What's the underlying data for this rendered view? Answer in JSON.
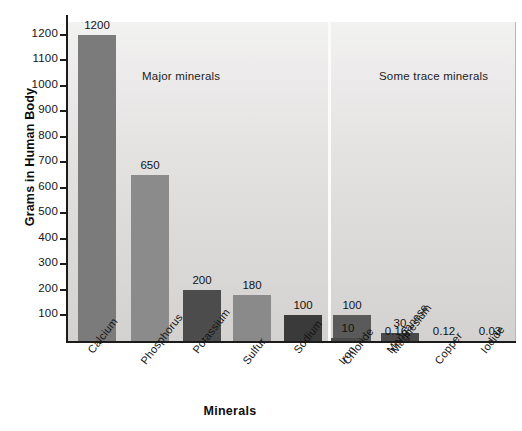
{
  "chart_data": {
    "type": "bar",
    "title": "",
    "xlabel": "Minerals",
    "ylabel": "Grams in Human Body",
    "ylim": [
      0,
      1250
    ],
    "ytick_labels": [
      "1200",
      "1100",
      "1000",
      "900",
      "800",
      "700",
      "600",
      "500",
      "400",
      "300",
      "200",
      "100"
    ],
    "ytick_values": [
      1200,
      1100,
      1000,
      900,
      800,
      700,
      600,
      500,
      400,
      300,
      200,
      100
    ],
    "grid": false,
    "legend": "none",
    "categories": [
      "Calcium",
      "Phosphorus",
      "Potassium",
      "Sulfur",
      "Sodium",
      "Chloride",
      "Magnesium",
      "Iron",
      "Manganese",
      "Copper",
      "Iodide"
    ],
    "values": [
      1200,
      650,
      200,
      180,
      100,
      100,
      30,
      10,
      0.16,
      0.12,
      0.03
    ],
    "value_labels": [
      "1200",
      "650",
      "200",
      "180",
      "100",
      "100",
      "30",
      "10",
      "0.16",
      "0.12",
      "0.03"
    ],
    "annotations": [
      {
        "text": "Major minerals",
        "group": "major"
      },
      {
        "text": "Some trace minerals",
        "group": "trace"
      }
    ],
    "groups": [
      {
        "name": "Major minerals",
        "categories": [
          "Calcium",
          "Phosphorus",
          "Potassium",
          "Sulfur",
          "Sodium",
          "Chloride",
          "Magnesium"
        ]
      },
      {
        "name": "Some trace minerals",
        "categories": [
          "Iron",
          "Manganese",
          "Copper",
          "Iodide"
        ]
      }
    ],
    "bar_colors": [
      "#7b7b7b",
      "#8b8b8b",
      "#4c4c4c",
      "#8a8a8a",
      "#3a3a3a",
      "#5a5a5a",
      "#4a4a4a",
      "#4a4a4a",
      "#4a4a4a",
      "#4a4a4a",
      "#4a4a4a"
    ]
  },
  "colors": {
    "axis": "#1b1b1b",
    "plot_bg_top": "#f2f2f1",
    "plot_bg_bottom": "#d4d2d0",
    "divider": "#fbfbfa",
    "text": "#141414"
  }
}
